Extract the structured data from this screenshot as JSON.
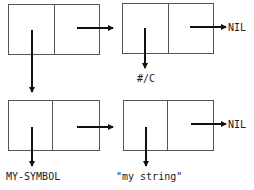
{
  "diagram": {
    "type": "cons-cell box-and-pointer",
    "cells": [
      {
        "id": "cell-1",
        "car": "cell-3",
        "cdr": "cell-2"
      },
      {
        "id": "cell-2",
        "car": "#/C",
        "cdr": "NIL"
      },
      {
        "id": "cell-3",
        "car": "MY-SYMBOL",
        "cdr": "cell-4"
      },
      {
        "id": "cell-4",
        "car": "\"my string\"",
        "cdr": "NIL"
      }
    ],
    "labels": {
      "nil_top": "NIL",
      "char_c": "#/C",
      "nil_bottom": "NIL",
      "symbol": "MY-SYMBOL",
      "string": "\"my string\""
    }
  }
}
